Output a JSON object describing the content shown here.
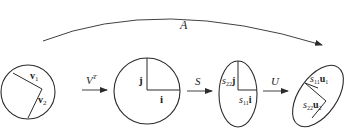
{
  "diagram": {
    "colors": {
      "stroke": "#2b2b2b",
      "text": "#222222",
      "background": "#ffffff"
    },
    "composite_arrow": {
      "label": "A"
    },
    "stages": [
      {
        "shape": "circle",
        "vectors": [
          {
            "label": "v",
            "sub": "1"
          },
          {
            "label": "v",
            "sub": "2"
          }
        ]
      },
      {
        "shape": "circle",
        "vectors": [
          {
            "label": "j"
          },
          {
            "label": "i"
          }
        ]
      },
      {
        "shape": "ellipse",
        "vectors": [
          {
            "coef": "s",
            "coef_sub": "22",
            "label": "j"
          },
          {
            "coef": "s",
            "coef_sub": "11",
            "label": "i"
          }
        ]
      },
      {
        "shape": "rotated-ellipse",
        "vectors": [
          {
            "coef": "s",
            "coef_sub": "11",
            "label": "u",
            "sub": "1"
          },
          {
            "coef": "s",
            "coef_sub": "22",
            "label": "u",
            "sub": "2"
          }
        ]
      }
    ],
    "transforms": [
      {
        "label": "V",
        "sup": "T"
      },
      {
        "label": "S"
      },
      {
        "label": "U"
      }
    ]
  }
}
